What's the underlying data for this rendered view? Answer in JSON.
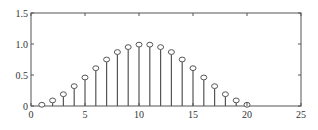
{
  "chart_data": {
    "type": "stem",
    "title": "",
    "xlabel": "",
    "ylabel": "",
    "xlim": [
      0,
      25
    ],
    "ylim": [
      0,
      1.5
    ],
    "grid": false,
    "legend": null,
    "x_ticks": [
      "0",
      "5",
      "10",
      "15",
      "20",
      "25"
    ],
    "y_ticks": [
      "0",
      "0.5",
      "1.0",
      "1.5"
    ],
    "marker": "open-circle",
    "color": "#555555",
    "x": [
      1,
      2,
      3,
      4,
      5,
      6,
      7,
      8,
      9,
      10,
      11,
      12,
      13,
      14,
      15,
      16,
      17,
      18,
      19,
      20
    ],
    "values": [
      0.02,
      0.09,
      0.19,
      0.32,
      0.46,
      0.61,
      0.75,
      0.87,
      0.95,
      0.99,
      0.99,
      0.95,
      0.87,
      0.75,
      0.61,
      0.46,
      0.32,
      0.19,
      0.09,
      0.02
    ]
  }
}
